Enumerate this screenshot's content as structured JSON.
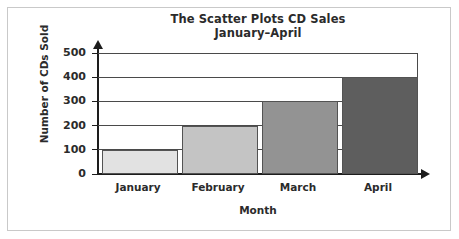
{
  "chart_data": {
    "type": "bar",
    "title": "The Scatter Plots CD Sales",
    "subtitle": "January–April",
    "categories": [
      "January",
      "February",
      "March",
      "April"
    ],
    "values": [
      100,
      200,
      300,
      400
    ],
    "xlabel": "Month",
    "ylabel": "Number of CDs Sold",
    "ylim": [
      0,
      500
    ],
    "ytick_labels": [
      "0",
      "100",
      "200",
      "300",
      "400",
      "500"
    ],
    "ytick_values": [
      0,
      100,
      200,
      300,
      400,
      500
    ],
    "grid": true,
    "legend": "none",
    "bar_colors": [
      "#e2e2e2",
      "#c4c4c4",
      "#939393",
      "#5e5e5e"
    ],
    "bar_border_color": "#535353",
    "axis_color": "#1d1d1d",
    "grid_color": "#4a4a4a",
    "text_color": "#2b2b2b",
    "frame_color": "#c9c9c9",
    "background_color": "#ffffff"
  }
}
